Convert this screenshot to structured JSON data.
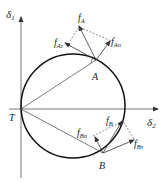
{
  "diagram": {
    "axes": {
      "vertical_label": "δ",
      "vertical_sub": "1",
      "horizontal_label": "δ",
      "horizontal_sub": "2",
      "origin_label": "T"
    },
    "points": {
      "A": "A",
      "B": "B"
    },
    "vectors": {
      "fA": {
        "main": "f",
        "sub": "A"
      },
      "fAtau": {
        "main": "f",
        "sub": "Aτ"
      },
      "fAn": {
        "main": "f",
        "sub": "An"
      },
      "fB": {
        "main": "f",
        "sub": "B"
      },
      "fBn": {
        "main": "f",
        "sub": "Bn"
      },
      "fBtau": {
        "main": "f",
        "sub": "Bτ"
      }
    },
    "colors": {
      "line": "#222222",
      "axis": "#555555"
    }
  }
}
